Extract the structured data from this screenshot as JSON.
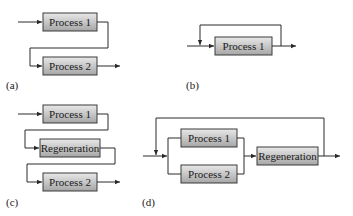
{
  "diagrams": {
    "a": {
      "caption": "(a)",
      "boxes": [
        "Process 1",
        "Process 2"
      ],
      "description": "Series: Process 1 then Process 2"
    },
    "b": {
      "caption": "(b)",
      "boxes": [
        "Process 1"
      ],
      "description": "Process 1 with recycle loop"
    },
    "c": {
      "caption": "(c)",
      "boxes": [
        "Process 1",
        "Regeneration",
        "Process 2"
      ],
      "description": "Series with regeneration between processes"
    },
    "d": {
      "caption": "(d)",
      "boxes": [
        "Process 1",
        "Process 2",
        "Regeneration"
      ],
      "description": "Parallel processes followed by regeneration with recycle loop"
    }
  },
  "colors": {
    "box_fill_top": "#e6e6e6",
    "box_fill_bottom": "#a8a8a8",
    "stroke": "#2a2a2a"
  }
}
